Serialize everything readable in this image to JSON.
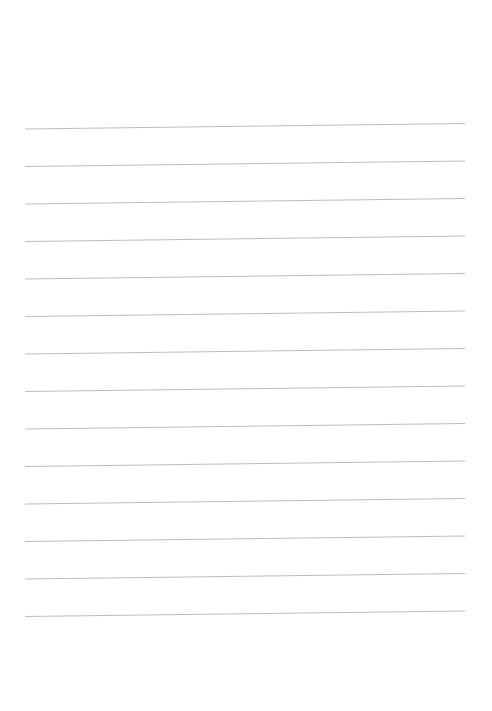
{
  "page": {
    "kind": "blank-lined-paper",
    "width": 492,
    "height": 711,
    "background_color": "#ffffff",
    "title": "",
    "visible_text": ""
  },
  "ruling": {
    "line_count": 14,
    "line_color": "#b9bdc1",
    "line_thickness": 1,
    "left_margin_x": 25,
    "right_margin_x": 465,
    "line_length": 440,
    "first_line_y": 129,
    "line_spacing": 37.5,
    "slant_rise_px": -5.5,
    "slant_degrees": -0.72,
    "lines": [
      {
        "index": 1,
        "x1": 25,
        "y1": 129.0,
        "x2": 465,
        "y2": 123.5
      },
      {
        "index": 2,
        "x1": 25,
        "y1": 166.5,
        "x2": 465,
        "y2": 161.0
      },
      {
        "index": 3,
        "x1": 25,
        "y1": 204.0,
        "x2": 465,
        "y2": 198.5
      },
      {
        "index": 4,
        "x1": 25,
        "y1": 241.5,
        "x2": 465,
        "y2": 236.0
      },
      {
        "index": 5,
        "x1": 25,
        "y1": 279.0,
        "x2": 465,
        "y2": 273.5
      },
      {
        "index": 6,
        "x1": 25,
        "y1": 316.5,
        "x2": 465,
        "y2": 311.0
      },
      {
        "index": 7,
        "x1": 25,
        "y1": 354.0,
        "x2": 465,
        "y2": 348.5
      },
      {
        "index": 8,
        "x1": 25,
        "y1": 391.5,
        "x2": 465,
        "y2": 386.0
      },
      {
        "index": 9,
        "x1": 25,
        "y1": 429.0,
        "x2": 465,
        "y2": 423.5
      },
      {
        "index": 10,
        "x1": 25,
        "y1": 466.5,
        "x2": 465,
        "y2": 461.0
      },
      {
        "index": 11,
        "x1": 25,
        "y1": 504.0,
        "x2": 465,
        "y2": 498.5
      },
      {
        "index": 12,
        "x1": 25,
        "y1": 541.5,
        "x2": 465,
        "y2": 536.0
      },
      {
        "index": 13,
        "x1": 25,
        "y1": 579.0,
        "x2": 465,
        "y2": 573.5
      },
      {
        "index": 14,
        "x1": 25,
        "y1": 616.5,
        "x2": 465,
        "y2": 611.0
      }
    ]
  }
}
